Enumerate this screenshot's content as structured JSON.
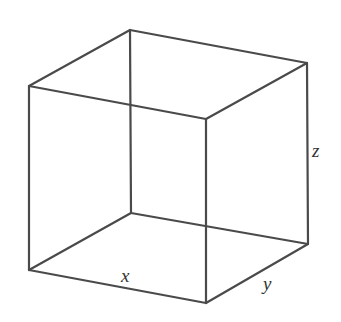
{
  "diagram": {
    "type": "wireframe-cube",
    "stroke_color": "#4a4a4a",
    "label_color": "#333333",
    "vertices": {
      "back_top": [
        130,
        30
      ],
      "left_top": [
        29,
        86
      ],
      "right_top": [
        307,
        63
      ],
      "front_top": [
        206,
        119
      ],
      "back_bottom": [
        131,
        213
      ],
      "left_bottom": [
        29,
        270
      ],
      "right_bottom": [
        308,
        244
      ],
      "front_bottom": [
        206,
        303
      ]
    },
    "edges": [
      [
        "left_top",
        "back_top"
      ],
      [
        "back_top",
        "right_top"
      ],
      [
        "right_top",
        "front_top"
      ],
      [
        "front_top",
        "left_top"
      ],
      [
        "left_bottom",
        "back_bottom"
      ],
      [
        "back_bottom",
        "right_bottom"
      ],
      [
        "right_bottom",
        "front_bottom"
      ],
      [
        "front_bottom",
        "left_bottom"
      ],
      [
        "left_top",
        "left_bottom"
      ],
      [
        "back_top",
        "back_bottom"
      ],
      [
        "right_top",
        "right_bottom"
      ],
      [
        "front_top",
        "front_bottom"
      ]
    ],
    "labels": {
      "x": {
        "text": "x",
        "pos": [
          121,
          282
        ]
      },
      "y": {
        "text": "y",
        "pos": [
          263,
          290
        ]
      },
      "z": {
        "text": "z",
        "pos": [
          312,
          157
        ]
      }
    }
  }
}
